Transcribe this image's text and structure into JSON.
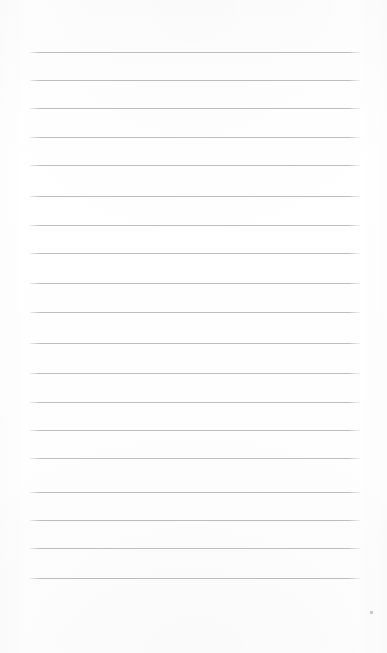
{
  "document": {
    "kind": "lined-notebook-page",
    "title": "Blank Ruled Paper",
    "content_text": "",
    "page_width_px": 387,
    "page_height_px": 653,
    "background_color": "#fefefe",
    "rule_color": "#bdbdbd",
    "rule_thickness_px": 1,
    "margin_left_px": 30,
    "margin_right_px": 27,
    "rule_spacing_px": 28.3,
    "rule_count": 19
  },
  "rules": [
    {
      "index": 1,
      "y": 52,
      "x_start": 30,
      "x_end": 360
    },
    {
      "index": 2,
      "y": 80,
      "x_start": 30,
      "x_end": 360
    },
    {
      "index": 3,
      "y": 108,
      "x_start": 30,
      "x_end": 360
    },
    {
      "index": 4,
      "y": 137,
      "x_start": 30,
      "x_end": 360
    },
    {
      "index": 5,
      "y": 165,
      "x_start": 30,
      "x_end": 360
    },
    {
      "index": 6,
      "y": 196,
      "x_start": 30,
      "x_end": 360
    },
    {
      "index": 7,
      "y": 225,
      "x_start": 30,
      "x_end": 360
    },
    {
      "index": 8,
      "y": 253,
      "x_start": 30,
      "x_end": 360
    },
    {
      "index": 9,
      "y": 283,
      "x_start": 30,
      "x_end": 360
    },
    {
      "index": 10,
      "y": 312,
      "x_start": 30,
      "x_end": 360
    },
    {
      "index": 11,
      "y": 343,
      "x_start": 30,
      "x_end": 360
    },
    {
      "index": 12,
      "y": 373,
      "x_start": 30,
      "x_end": 360
    },
    {
      "index": 13,
      "y": 402,
      "x_start": 30,
      "x_end": 360
    },
    {
      "index": 14,
      "y": 430,
      "x_start": 30,
      "x_end": 360
    },
    {
      "index": 15,
      "y": 458,
      "x_start": 30,
      "x_end": 360
    },
    {
      "index": 16,
      "y": 492,
      "x_start": 30,
      "x_end": 360
    },
    {
      "index": 17,
      "y": 520,
      "x_start": 30,
      "x_end": 360
    },
    {
      "index": 18,
      "y": 548,
      "x_start": 30,
      "x_end": 360
    },
    {
      "index": 19,
      "y": 578,
      "x_start": 30,
      "x_end": 360
    }
  ],
  "artifacts": [
    {
      "name": "scan-speck",
      "x": 370,
      "y": 611,
      "width": 3,
      "height": 3
    }
  ]
}
